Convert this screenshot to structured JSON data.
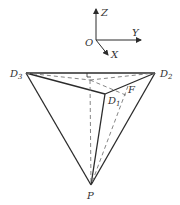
{
  "diagram": {
    "type": "3d-geometry",
    "axes": {
      "origin_label": "O",
      "x_label": "X",
      "y_label": "Y",
      "z_label": "Z"
    },
    "points": [
      {
        "name": "D3",
        "base": "D",
        "sub": "3"
      },
      {
        "name": "D2",
        "base": "D",
        "sub": "2"
      },
      {
        "name": "D1",
        "base": "D",
        "sub": "1"
      },
      {
        "name": "F",
        "base": "F",
        "sub": ""
      },
      {
        "name": "P",
        "base": "P",
        "sub": ""
      },
      {
        "name": "E",
        "base": "E",
        "sub": ""
      }
    ],
    "colors": {
      "line": "#2b2b2b",
      "dashed": "#777777",
      "background": "#ffffff"
    }
  }
}
